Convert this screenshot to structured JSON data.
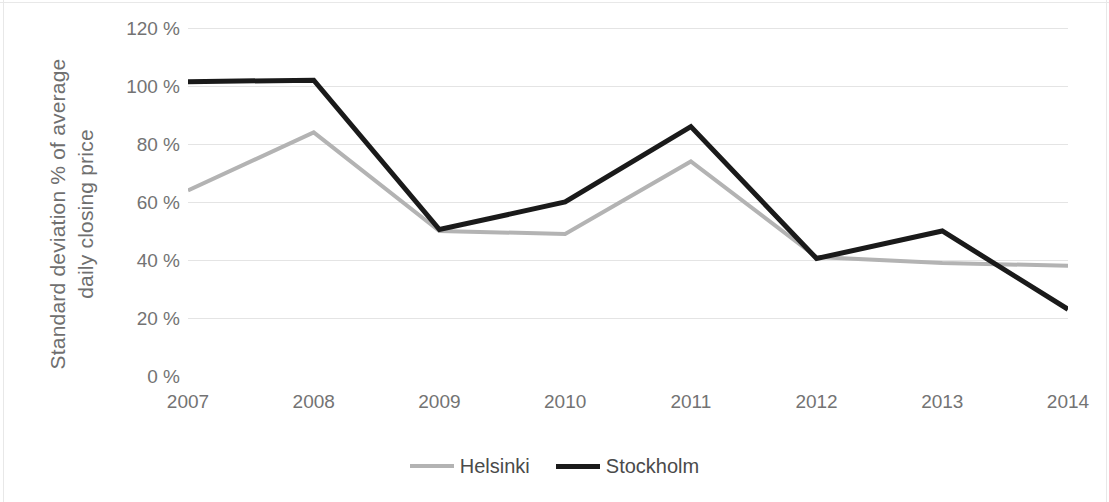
{
  "chart_data": {
    "type": "line",
    "title": "",
    "subtitle": "",
    "xlabel": "",
    "ylabel": "Standard deviation % of average daily closing price",
    "ylabel_line1": "Standard deviation % of average",
    "ylabel_line2": "daily closing price",
    "categories": [
      "2007",
      "2008",
      "2009",
      "2010",
      "2011",
      "2012",
      "2013",
      "2014"
    ],
    "x": [
      2007,
      2008,
      2009,
      2010,
      2011,
      2012,
      2013,
      2014
    ],
    "series": [
      {
        "name": "Helsinki",
        "color": "#b3b3b3",
        "values": [
          64,
          84,
          50,
          49,
          74,
          41,
          39,
          38
        ]
      },
      {
        "name": "Stockholm",
        "color": "#1a1a1a",
        "values": [
          101.5,
          102,
          50.5,
          60,
          86,
          40.5,
          50,
          23
        ]
      }
    ],
    "ylim": [
      0,
      120
    ],
    "ytick_values": [
      0,
      20,
      40,
      60,
      80,
      100,
      120
    ],
    "ytick_labels": [
      "0 %",
      "20 %",
      "40 %",
      "60 %",
      "80 %",
      "100 %",
      "120 %"
    ],
    "grid": true,
    "grid_axis": "y",
    "grid_color": "#e4e4e4",
    "legend_position": "bottom",
    "background_color": "#ffffff",
    "axis_label_color": "#737373"
  },
  "legend": {
    "entries": [
      {
        "label": "Helsinki",
        "color": "#b3b3b3"
      },
      {
        "label": "Stockholm",
        "color": "#1a1a1a"
      }
    ]
  }
}
